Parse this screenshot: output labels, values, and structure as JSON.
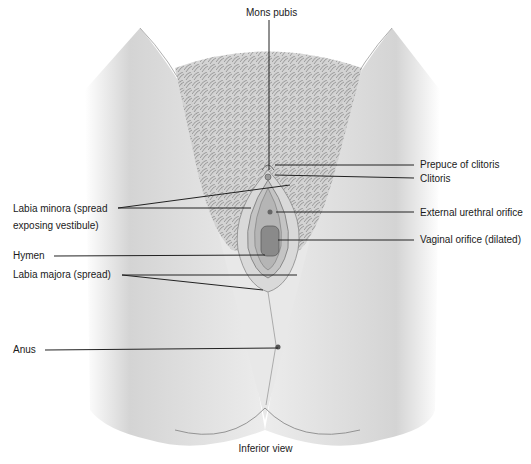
{
  "figure": {
    "caption": "Inferior view",
    "colors": {
      "skin_light": "#efefef",
      "skin_shade": "#bdbdbd",
      "hair": "#7a7a7a",
      "leader_line": "#222222",
      "text": "#1a1a1a"
    }
  },
  "labels": {
    "mons_pubis": "Mons pubis",
    "prepuce_of_clitoris": "Prepuce of clitoris",
    "clitoris": "Clitoris",
    "labia_minora_line1": "Labia minora (spread",
    "labia_minora_line2": "exposing vestibule)",
    "external_urethral_orifice": "External urethral orifice",
    "hymen": "Hymen",
    "vaginal_orifice": "Vaginal orifice (dilated)",
    "labia_majora": "Labia majora (spread)",
    "anus": "Anus"
  }
}
